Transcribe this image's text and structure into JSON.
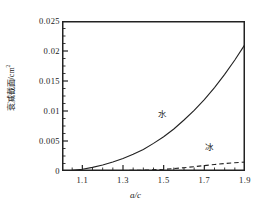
{
  "chart_data": {
    "type": "line",
    "title": "",
    "xlabel": "a/c",
    "ylabel": "衰减截面/cm²",
    "ylabel_text": "衰减截面/cm",
    "ylabel_exponent": "2",
    "xlim": [
      1.0,
      1.9
    ],
    "ylim": [
      0,
      0.025
    ],
    "grid": false,
    "legend": "inline annotations",
    "xticks": [
      "1.1",
      "1.3",
      "1.5",
      "1.7",
      "1.9"
    ],
    "xtick_values": [
      1.1,
      1.3,
      1.5,
      1.7,
      1.9
    ],
    "yticks": [
      "0",
      "0.005",
      "0.01",
      "0.015",
      "0.02",
      "0.025"
    ],
    "ytick_values": [
      0,
      0.005,
      0.01,
      0.015,
      0.02,
      0.025
    ],
    "minor_ticks": true,
    "series": [
      {
        "name": "水",
        "name_en": "water",
        "style": "solid",
        "color": "#222222",
        "annotation": "水",
        "x": [
          1.0,
          1.05,
          1.1,
          1.15,
          1.2,
          1.25,
          1.3,
          1.35,
          1.4,
          1.45,
          1.5,
          1.55,
          1.6,
          1.65,
          1.7,
          1.75,
          1.8,
          1.85,
          1.9
        ],
        "values": [
          0.0,
          0.0001,
          0.0003,
          0.0006,
          0.001,
          0.0015,
          0.0021,
          0.0028,
          0.0036,
          0.0046,
          0.0057,
          0.007,
          0.0085,
          0.0101,
          0.0119,
          0.0139,
          0.0161,
          0.0185,
          0.0211
        ]
      },
      {
        "name": "冰",
        "name_en": "ice",
        "style": "dashed",
        "color": "#222222",
        "annotation": "冰",
        "x": [
          1.0,
          1.1,
          1.2,
          1.3,
          1.4,
          1.5,
          1.55,
          1.6,
          1.65,
          1.7,
          1.75,
          1.8,
          1.85,
          1.9
        ],
        "values": [
          0.0,
          2e-05,
          4e-05,
          8e-05,
          0.00014,
          0.00028,
          0.0004,
          0.00055,
          0.00072,
          0.0009,
          0.00108,
          0.00125,
          0.00138,
          0.00148
        ]
      }
    ]
  },
  "axis": {
    "x_title": "a/c",
    "y_title_main": "衰减截面/cm",
    "y_title_sup": "2"
  },
  "annotations": {
    "water": "水",
    "ice": "冰"
  },
  "colors": {
    "frame": "#222222",
    "curve": "#222222",
    "background": "#ffffff"
  }
}
